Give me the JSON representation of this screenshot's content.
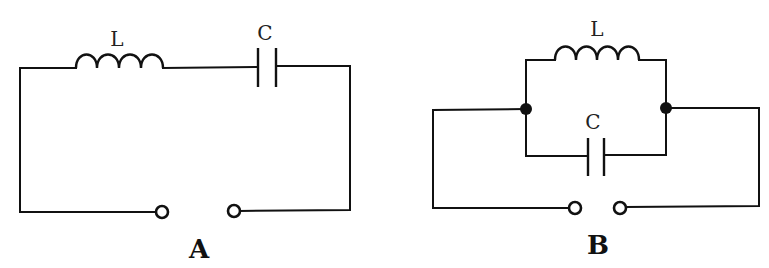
{
  "circuits": [
    {
      "id": "A",
      "label": "A",
      "topology": "series LC",
      "components": {
        "inductor": {
          "label": "L"
        },
        "capacitor": {
          "label": "C"
        }
      },
      "terminals": 2
    },
    {
      "id": "B",
      "label": "B",
      "topology": "parallel LC",
      "components": {
        "inductor": {
          "label": "L"
        },
        "capacitor": {
          "label": "C"
        }
      },
      "terminals": 2,
      "junctions": 2
    }
  ],
  "colors": {
    "line": "#111111",
    "background": "#ffffff"
  }
}
